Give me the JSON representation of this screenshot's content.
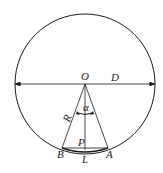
{
  "diagram": {
    "type": "geometry",
    "colors": {
      "stroke": "#1a1a1a",
      "background": "#ffffff"
    },
    "labels": {
      "center": "O",
      "diameter": "D",
      "radius": "R",
      "angle": "α",
      "point_p": "P",
      "point_b": "B",
      "point_a": "A",
      "chord_length": "L"
    }
  }
}
